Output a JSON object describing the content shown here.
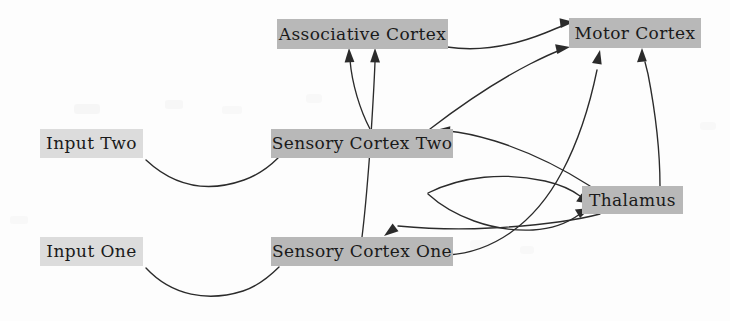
{
  "diagram": {
    "canvas": {
      "width": 730,
      "height": 321
    },
    "palette": {
      "node_fill_dark": "#b8b8b8",
      "node_fill_light": "#dcdcdc",
      "edge_color": "#2b2b2b",
      "text_color": "#1a1a1a",
      "background": "#fdfdfd"
    },
    "nodes": [
      {
        "id": "input_two",
        "label": "Input Two",
        "x": 40,
        "y": 129,
        "w": 103,
        "h": 29,
        "fill": "light",
        "font_size": 17
      },
      {
        "id": "input_one",
        "label": "Input One",
        "x": 40,
        "y": 237,
        "w": 103,
        "h": 29,
        "fill": "light",
        "font_size": 17
      },
      {
        "id": "associative_cortex",
        "label": "Associative Cortex",
        "x": 277,
        "y": 19,
        "w": 171,
        "h": 30,
        "fill": "dark",
        "font_size": 17
      },
      {
        "id": "sensory_cortex_two",
        "label": "Sensory Cortex Two",
        "x": 271,
        "y": 129,
        "w": 182,
        "h": 29,
        "fill": "dark",
        "font_size": 17
      },
      {
        "id": "sensory_cortex_one",
        "label": "Sensory Cortex One",
        "x": 271,
        "y": 237,
        "w": 182,
        "h": 29,
        "fill": "dark",
        "font_size": 17
      },
      {
        "id": "motor_cortex",
        "label": "Motor Cortex",
        "x": 569,
        "y": 18,
        "w": 132,
        "h": 30,
        "fill": "dark",
        "font_size": 17
      },
      {
        "id": "thalamus",
        "label": "Thalamus",
        "x": 582,
        "y": 186,
        "w": 101,
        "h": 28,
        "fill": "dark",
        "font_size": 17
      }
    ],
    "edges": [
      {
        "id": "input-two-to-sensory-two",
        "from": "input_two",
        "to": "sensory_cortex_two",
        "arrowhead": false
      },
      {
        "id": "input-one-to-sensory-one",
        "from": "input_one",
        "to": "sensory_cortex_one",
        "arrowhead": false
      },
      {
        "id": "sensory-two-to-associative",
        "from": "sensory_cortex_two",
        "to": "associative_cortex",
        "arrowhead": true
      },
      {
        "id": "sensory-one-to-associative",
        "from": "sensory_cortex_one",
        "to": "associative_cortex",
        "arrowhead": true
      },
      {
        "id": "sensory-two-to-motor",
        "from": "sensory_cortex_two",
        "to": "motor_cortex",
        "arrowhead": true
      },
      {
        "id": "sensory-one-to-motor",
        "from": "sensory_cortex_one",
        "to": "motor_cortex",
        "arrowhead": true
      },
      {
        "id": "associative-to-motor",
        "from": "associative_cortex",
        "to": "motor_cortex",
        "arrowhead": true
      },
      {
        "id": "thalamus-to-motor",
        "from": "thalamus",
        "to": "motor_cortex",
        "arrowhead": true
      },
      {
        "id": "sensory-two-to-thalamus",
        "from": "sensory_cortex_two",
        "to": "thalamus",
        "arrowhead": true
      },
      {
        "id": "thalamus-to-sensory-one",
        "from": "thalamus",
        "to": "sensory_cortex_one",
        "arrowhead": true
      },
      {
        "id": "thalamus-to-sensory-two",
        "from": "thalamus",
        "to": "sensory_cortex_two",
        "arrowhead": true
      },
      {
        "id": "sensory-one-to-thalamus",
        "from": "sensory_cortex_one",
        "to": "thalamus",
        "arrowhead": true
      }
    ]
  }
}
